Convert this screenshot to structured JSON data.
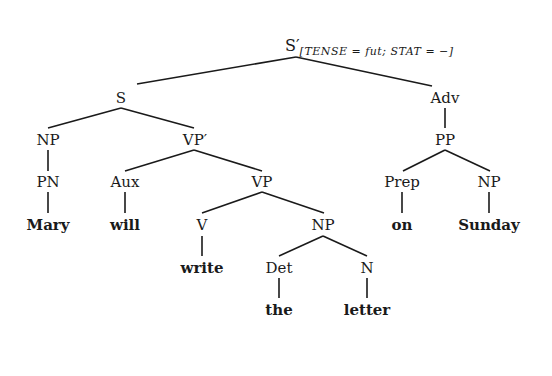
{
  "tree": {
    "root": {
      "label": "S′",
      "features": "[TENSE = fut; STAT = −]"
    },
    "nodes": {
      "s": "S",
      "adv": "Adv",
      "np_subj": "NP",
      "vp_bar": "VP′",
      "pp": "PP",
      "pn": "PN",
      "aux": "Aux",
      "vp": "VP",
      "prep": "Prep",
      "np_pp": "NP",
      "v": "V",
      "np_obj": "NP",
      "det": "Det",
      "n": "N"
    },
    "words": {
      "mary": "Mary",
      "will": "will",
      "write": "write",
      "the": "the",
      "letter": "letter",
      "on": "on",
      "sunday": "Sunday"
    }
  }
}
